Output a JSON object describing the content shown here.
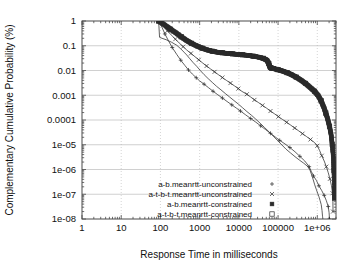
{
  "chart_data": {
    "type": "line",
    "title": "",
    "xlabel": "Response Time in milliseconds",
    "ylabel": "Complementary Cumulative Probability (%)",
    "xscale": "log",
    "yscale": "log",
    "xlim": [
      1,
      3000000
    ],
    "ylim": [
      1e-08,
      1
    ],
    "grid": true,
    "legend_position": "lower-center",
    "xticks": [
      "1",
      "10",
      "100",
      "1000",
      "10000",
      "100000",
      "1e+06"
    ],
    "xtick_values": [
      1,
      10,
      100,
      1000,
      10000,
      100000,
      1000000
    ],
    "yticks": [
      "1",
      "0.1",
      "0.01",
      "0.001",
      "0.0001",
      "1e-05",
      "1e-06",
      "1e-07",
      "1e-08"
    ],
    "ytick_values": [
      1,
      0.1,
      0.01,
      0.001,
      0.0001,
      1e-05,
      1e-06,
      1e-07,
      1e-08
    ],
    "series": [
      {
        "name": "a-b.meanrtt-unconstrained",
        "marker": "plus",
        "points": [
          [
            90,
            1.0
          ],
          [
            110,
            0.55
          ],
          [
            130,
            0.3
          ],
          [
            160,
            0.16
          ],
          [
            200,
            0.085
          ],
          [
            260,
            0.045
          ],
          [
            330,
            0.026
          ],
          [
            420,
            0.016
          ],
          [
            520,
            0.0105
          ],
          [
            650,
            0.0072
          ],
          [
            820,
            0.0051
          ],
          [
            1000,
            0.0038
          ],
          [
            1300,
            0.0028
          ],
          [
            1700,
            0.002
          ],
          [
            2200,
            0.00145
          ],
          [
            2900,
            0.00105
          ],
          [
            3800,
            0.00077
          ],
          [
            5000,
            0.00056
          ],
          [
            6600,
            0.00041
          ],
          [
            8700,
            0.0003
          ],
          [
            11000,
            0.00023
          ],
          [
            15000,
            0.00016
          ],
          [
            20000,
            0.000115
          ],
          [
            27000,
            8.2e-05
          ],
          [
            36000,
            5.8e-05
          ],
          [
            48000,
            4.1e-05
          ],
          [
            64000,
            2.9e-05
          ],
          [
            85000,
            2.05e-05
          ],
          [
            110000,
            1.5e-05
          ],
          [
            150000,
            1.08e-05
          ],
          [
            200000,
            7.7e-06
          ],
          [
            270000,
            5.2e-06
          ],
          [
            360000,
            3.4e-06
          ],
          [
            480000,
            2.2e-06
          ],
          [
            620000,
            1.3e-06
          ],
          [
            700000,
            8.5e-07
          ],
          [
            800000,
            5.5e-07
          ],
          [
            950000,
            3.6e-07
          ],
          [
            1100000,
            2.2e-07
          ],
          [
            1300000,
            1.4e-07
          ],
          [
            1500000,
            9e-08
          ],
          [
            1700000,
            5.5e-08
          ],
          [
            1900000,
            3.2e-08
          ],
          [
            2000000,
            1.8e-08
          ],
          [
            2050000,
            1e-08
          ]
        ]
      },
      {
        "name": "a-t-b-t.meanrtt-unconstrained",
        "marker": "cross",
        "points": [
          [
            90,
            1.0
          ],
          [
            120,
            0.62
          ],
          [
            150,
            0.4
          ],
          [
            190,
            0.27
          ],
          [
            240,
            0.185
          ],
          [
            300,
            0.13
          ],
          [
            380,
            0.092
          ],
          [
            470,
            0.067
          ],
          [
            600,
            0.049
          ],
          [
            760,
            0.036
          ],
          [
            950,
            0.027
          ],
          [
            1200,
            0.02
          ],
          [
            1500,
            0.0152
          ],
          [
            1900,
            0.0115
          ],
          [
            2400,
            0.0088
          ],
          [
            3000,
            0.0068
          ],
          [
            3800,
            0.0052
          ],
          [
            4800,
            0.004
          ],
          [
            6100,
            0.0031
          ],
          [
            7700,
            0.0024
          ],
          [
            9700,
            0.00185
          ],
          [
            12000,
            0.00143
          ],
          [
            16000,
            0.0011
          ],
          [
            20000,
            0.00085
          ],
          [
            25000,
            0.00065
          ],
          [
            32000,
            0.0005
          ],
          [
            40000,
            0.00039
          ],
          [
            51000,
            0.0003
          ],
          [
            64000,
            0.00023
          ],
          [
            81000,
            0.000178
          ],
          [
            102000,
            0.000137
          ],
          [
            130000,
            0.000105
          ],
          [
            165000,
            8.1e-05
          ],
          [
            210000,
            6.2e-05
          ],
          [
            265000,
            4.75e-05
          ],
          [
            335000,
            3.65e-05
          ],
          [
            420000,
            2.8e-05
          ],
          [
            530000,
            2.15e-05
          ],
          [
            670000,
            1.63e-05
          ],
          [
            850000,
            1.23e-05
          ],
          [
            1000000,
            9.1e-06
          ],
          [
            1150000,
            5.8e-06
          ],
          [
            1300000,
            3.6e-06
          ],
          [
            1500000,
            2.2e-06
          ],
          [
            1700000,
            1.3e-06
          ],
          [
            1900000,
            7.5e-07
          ],
          [
            2100000,
            4.2e-07
          ],
          [
            2300000,
            2.2e-07
          ],
          [
            2450000,
            1.1e-07
          ],
          [
            2500000,
            5e-08
          ],
          [
            2520000,
            2e-08
          ]
        ]
      },
      {
        "name": "a-b.meanrtt-constrained",
        "marker": "filled-square",
        "points": [
          [
            90,
            1.0
          ],
          [
            130,
            0.68
          ],
          [
            180,
            0.47
          ],
          [
            250,
            0.33
          ],
          [
            340,
            0.23
          ],
          [
            460,
            0.165
          ],
          [
            620,
            0.125
          ],
          [
            850,
            0.098
          ],
          [
            1150,
            0.08
          ],
          [
            1550,
            0.068
          ],
          [
            2100,
            0.06
          ],
          [
            2800,
            0.055
          ],
          [
            3800,
            0.052
          ],
          [
            5100,
            0.049
          ],
          [
            6900,
            0.047
          ],
          [
            9300,
            0.045
          ],
          [
            12500,
            0.043
          ],
          [
            17000,
            0.041
          ],
          [
            23000,
            0.038
          ],
          [
            31000,
            0.035
          ],
          [
            42000,
            0.031
          ],
          [
            52000,
            0.026
          ],
          [
            58000,
            0.019
          ],
          [
            62000,
            0.0135
          ],
          [
            68000,
            0.0125
          ],
          [
            80000,
            0.0118
          ],
          [
            100000,
            0.0108
          ],
          [
            130000,
            0.0095
          ],
          [
            170000,
            0.0082
          ],
          [
            220000,
            0.0068
          ],
          [
            290000,
            0.0054
          ],
          [
            380000,
            0.0041
          ],
          [
            500000,
            0.003
          ],
          [
            650000,
            0.0021
          ],
          [
            850000,
            0.00145
          ],
          [
            1050000,
            0.00098
          ],
          [
            1250000,
            0.0006
          ],
          [
            1450000,
            0.00034
          ],
          [
            1650000,
            0.00019
          ],
          [
            1850000,
            0.000105
          ],
          [
            2050000,
            5.5e-05
          ],
          [
            2250000,
            2.6e-05
          ],
          [
            2400000,
            1.05e-05
          ],
          [
            2550000,
            3.5e-06
          ],
          [
            2650000,
            9e-07
          ],
          [
            2720000,
            1.8e-07
          ],
          [
            2760000,
            7e-08
          ]
        ]
      },
      {
        "name": "a-t-b-t.meanrtt-constrained",
        "marker": "open-square",
        "points": [
          [
            90,
            1.0
          ],
          [
            130,
            0.68
          ],
          [
            180,
            0.47
          ],
          [
            250,
            0.33
          ],
          [
            340,
            0.23
          ],
          [
            460,
            0.165
          ],
          [
            620,
            0.125
          ],
          [
            850,
            0.098
          ],
          [
            1150,
            0.08
          ],
          [
            1550,
            0.068
          ],
          [
            2100,
            0.06
          ],
          [
            2800,
            0.055
          ],
          [
            3800,
            0.052
          ],
          [
            5100,
            0.049
          ],
          [
            6900,
            0.047
          ],
          [
            9300,
            0.045
          ],
          [
            12500,
            0.043
          ],
          [
            17000,
            0.041
          ],
          [
            23000,
            0.038
          ],
          [
            31000,
            0.035
          ],
          [
            42000,
            0.031
          ],
          [
            52000,
            0.026
          ],
          [
            58000,
            0.019
          ],
          [
            62000,
            0.0135
          ],
          [
            68000,
            0.0125
          ],
          [
            80000,
            0.0118
          ],
          [
            100000,
            0.0108
          ],
          [
            130000,
            0.0095
          ],
          [
            170000,
            0.0082
          ],
          [
            220000,
            0.0068
          ],
          [
            290000,
            0.0054
          ],
          [
            380000,
            0.0041
          ],
          [
            500000,
            0.003
          ],
          [
            650000,
            0.0021
          ],
          [
            850000,
            0.00145
          ],
          [
            1050000,
            0.00098
          ],
          [
            1250000,
            0.0006
          ],
          [
            1450000,
            0.00034
          ],
          [
            1650000,
            0.00019
          ],
          [
            1850000,
            0.000105
          ],
          [
            2050000,
            5.5e-05
          ],
          [
            2250000,
            2.6e-05
          ],
          [
            2400000,
            1.05e-05
          ],
          [
            2550000,
            3.5e-06
          ],
          [
            2650000,
            9e-07
          ],
          [
            2720000,
            1.8e-07
          ],
          [
            2760000,
            7e-08
          ]
        ]
      }
    ],
    "extra_curves": [
      {
        "name": "a-b.meanrtt-constrained-tail",
        "points": [
          [
            90,
            1.0
          ],
          [
            95,
            0.22
          ],
          [
            110,
            0.2
          ],
          [
            140,
            0.175
          ],
          [
            190,
            0.14
          ],
          [
            260,
            0.105
          ],
          [
            330,
            0.075
          ],
          [
            400,
            0.055
          ],
          [
            470,
            0.042
          ],
          [
            560,
            0.03
          ],
          [
            680,
            0.021
          ],
          [
            850,
            0.0145
          ],
          [
            1050,
            0.0098
          ],
          [
            1300,
            0.0068
          ],
          [
            1650,
            0.0047
          ],
          [
            2100,
            0.0033
          ],
          [
            2700,
            0.0023
          ],
          [
            3500,
            0.00165
          ],
          [
            4500,
            0.00118
          ],
          [
            5800,
            0.00085
          ],
          [
            7500,
            0.00061
          ],
          [
            9700,
            0.00044
          ],
          [
            12500,
            0.00031
          ],
          [
            16000,
            0.00022
          ],
          [
            21000,
            0.000155
          ],
          [
            27000,
            0.000108
          ],
          [
            35000,
            7.4e-05
          ],
          [
            45000,
            5e-05
          ],
          [
            58000,
            3.4e-05
          ],
          [
            75000,
            2.25e-05
          ],
          [
            97000,
            1.48e-05
          ],
          [
            125000,
            9.8e-06
          ],
          [
            160000,
            6.6e-06
          ],
          [
            210000,
            4.6e-06
          ],
          [
            270000,
            3.3e-06
          ],
          [
            350000,
            2.4e-06
          ],
          [
            450000,
            1.8e-06
          ],
          [
            580000,
            1.3e-06
          ],
          [
            650000,
            9.5e-07
          ],
          [
            720000,
            6e-07
          ],
          [
            790000,
            3.8e-07
          ],
          [
            860000,
            2.4e-07
          ],
          [
            940000,
            1.6e-07
          ],
          [
            1020000,
            1.1e-07
          ],
          [
            1100000,
            8e-08
          ],
          [
            1180000,
            5.5e-08
          ],
          [
            1260000,
            3.8e-08
          ],
          [
            1320000,
            2.2e-08
          ],
          [
            1360000,
            1.3e-08
          ],
          [
            1390000,
            1e-08
          ]
        ]
      }
    ],
    "annotations": []
  },
  "legend": {
    "entries": [
      {
        "label": "a-b.meanrtt-unconstrained",
        "marker": "+"
      },
      {
        "label": "a-t-b-t.meanrtt-unconstrained",
        "marker": "×"
      },
      {
        "label": "a-b.meanrtt-constrained",
        "marker": "■"
      },
      {
        "label": "a-t-b-t.meanrtt-constrained",
        "marker": "□"
      }
    ]
  },
  "colors": {
    "line": "#2b2b2b",
    "frame": "#4a4a4a",
    "grid": "#b8b8b8",
    "background": "#ffffff",
    "text": "#101010"
  }
}
